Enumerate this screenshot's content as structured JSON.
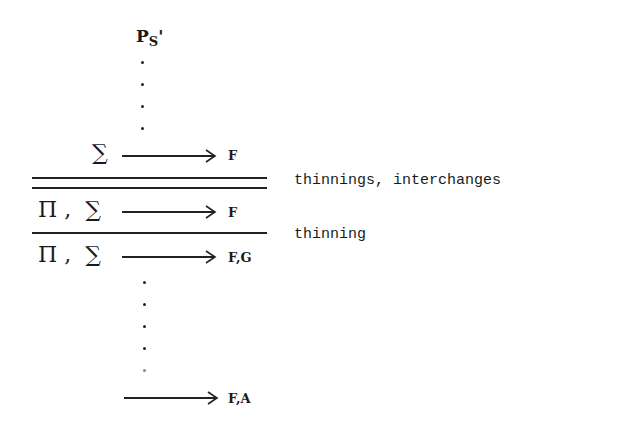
{
  "top_label": {
    "main": "P",
    "sub": "S",
    "prime": "'"
  },
  "rows": [
    {
      "antecedent": "∑",
      "succedent": "F"
    },
    {
      "antecedent": "Π ,  ∑",
      "succedent": "F"
    },
    {
      "antecedent": "Π ,  ∑",
      "succedent": "F,G"
    },
    {
      "antecedent": "",
      "succedent": "F,A"
    }
  ],
  "annotations": {
    "double_rule": "thinnings, interchanges",
    "single_rule": "thinning"
  }
}
